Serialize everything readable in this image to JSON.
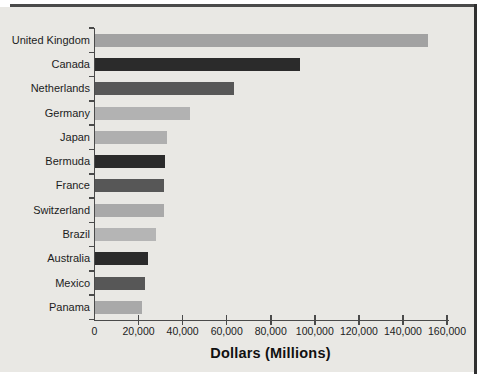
{
  "chart_data": {
    "type": "bar",
    "orientation": "horizontal",
    "title": "",
    "xlabel": "Dollars (Millions)",
    "ylabel": "",
    "categories": [
      "United Kingdom",
      "Canada",
      "Netherlands",
      "Germany",
      "Japan",
      "Bermuda",
      "France",
      "Switzerland",
      "Brazil",
      "Australia",
      "Mexico",
      "Panama"
    ],
    "values": [
      151000,
      93000,
      63000,
      43000,
      32500,
      31500,
      31000,
      31000,
      27500,
      24000,
      22500,
      21000
    ],
    "bar_colors": [
      "#a2a2a2",
      "#2b2b2b",
      "#575757",
      "#b2b2b2",
      "#afafaf",
      "#2b2b2b",
      "#575757",
      "#a9a9a9",
      "#b5b5b5",
      "#2b2b2b",
      "#575757",
      "#a9a9a9"
    ],
    "xlim": [
      0,
      160000
    ],
    "xticks": [
      0,
      20000,
      40000,
      60000,
      80000,
      100000,
      120000,
      140000,
      160000
    ],
    "xtick_labels": [
      "0",
      "20,000",
      "40,000",
      "60,000",
      "80,000",
      "100,000",
      "120,000",
      "140,000",
      "160,000"
    ],
    "grid": false,
    "legend": null
  },
  "colors": {
    "panel_bg": "#e9e8e4",
    "frame_top": "#4a4a4a",
    "frame_right": "#303030",
    "axis": "#4a4a4a",
    "text": "#1c1c1c"
  }
}
